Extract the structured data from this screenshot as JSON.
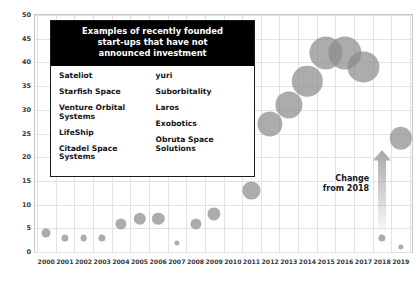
{
  "chart_data": {
    "type": "scatter",
    "title": "",
    "xlabel": "",
    "ylabel": "Number of Companies",
    "xlim": [
      1999.4,
      2019.6
    ],
    "ylim": [
      0,
      50
    ],
    "grid": true,
    "legend_position": "none",
    "x_ticks": [
      "2000",
      "2001",
      "2002",
      "2003",
      "2004",
      "2005",
      "2006",
      "2007",
      "2008",
      "2009",
      "2010",
      "2011",
      "2012",
      "2013",
      "2014",
      "2015",
      "2016",
      "2017",
      "2018",
      "2019"
    ],
    "y_ticks": [
      "0",
      "5",
      "10",
      "15",
      "20",
      "25",
      "30",
      "35",
      "40",
      "45",
      "50"
    ],
    "categories": [
      2000,
      2001,
      2002,
      2003,
      2004,
      2005,
      2006,
      2007,
      2008,
      2009,
      2010,
      2011,
      2012,
      2013,
      2014,
      2015,
      2016,
      2017,
      2018,
      2019
    ],
    "values": [
      4,
      3,
      3,
      3,
      6,
      7,
      7,
      2,
      6,
      8,
      18,
      13,
      27,
      31,
      36,
      42,
      42,
      39,
      3,
      24
    ],
    "sizes": [
      9,
      7,
      7,
      7,
      11,
      12,
      12,
      5,
      11,
      13,
      20,
      17,
      25,
      27,
      30,
      33,
      33,
      31,
      7,
      21
    ],
    "series": [
      {
        "name": "Founded start-ups",
        "points": [
          {
            "x": 2000,
            "y": 4,
            "r": 4.5
          },
          {
            "x": 2001,
            "y": 3,
            "r": 3.6
          },
          {
            "x": 2002,
            "y": 3,
            "r": 3.4
          },
          {
            "x": 2003,
            "y": 3,
            "r": 3.6
          },
          {
            "x": 2004,
            "y": 6,
            "r": 5.6
          },
          {
            "x": 2005,
            "y": 7,
            "r": 6.2
          },
          {
            "x": 2006,
            "y": 7,
            "r": 6.2
          },
          {
            "x": 2007,
            "y": 2,
            "r": 2.6
          },
          {
            "x": 2008,
            "y": 6,
            "r": 5.6
          },
          {
            "x": 2009,
            "y": 8,
            "r": 6.6
          },
          {
            "x": 2010,
            "y": 18,
            "r": 10.2
          },
          {
            "x": 2011,
            "y": 13,
            "r": 8.6
          },
          {
            "x": 2012,
            "y": 27,
            "r": 12.6
          },
          {
            "x": 2013,
            "y": 31,
            "r": 13.6
          },
          {
            "x": 2014,
            "y": 36,
            "r": 15.2
          },
          {
            "x": 2015,
            "y": 42,
            "r": 16.6
          },
          {
            "x": 2016,
            "y": 42,
            "r": 16.6
          },
          {
            "x": 2017,
            "y": 39,
            "r": 15.6
          },
          {
            "x": 2018,
            "y": 3,
            "r": 3.6
          },
          {
            "x": 2019,
            "y": 24,
            "r": 11.2
          },
          {
            "x": 2019,
            "y": 1,
            "r": 2.6
          }
        ]
      }
    ],
    "annotations": [
      {
        "name": "change-arrow",
        "label": "Change\nfrom 2018",
        "line1": "Change",
        "line2": "from 2018",
        "x": 2018,
        "y_from": 3,
        "y_to": 24
      }
    ]
  },
  "callout": {
    "header": "Examples of recently founded start-ups that have not announced investment",
    "header_lines": [
      "Examples of recently founded",
      "start-ups that have not",
      "announced investment"
    ],
    "columns": [
      {
        "items": [
          "Sateliot",
          "Starfish Space",
          "Venture Orbital Systems",
          "LifeShip",
          "Citadel Space Systems"
        ]
      },
      {
        "items": [
          "yuri",
          "Suborbitality",
          "Laros",
          "Exobotics",
          "Obruta Space Solutions"
        ]
      }
    ]
  },
  "colors": {
    "bubble": "#8c8c8f",
    "grid": "#e2e2e6",
    "frame": "#c8c8cc",
    "text": "#15151a",
    "callout_header_bg": "#000000",
    "arrow": "#a8a8ab"
  }
}
